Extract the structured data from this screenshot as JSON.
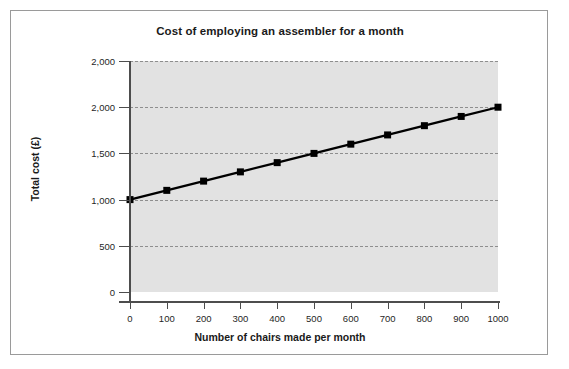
{
  "figure": {
    "border_color": "#9a9a9a",
    "background": "#ffffff"
  },
  "chart_data": {
    "type": "line",
    "title": "Cost of employing an assembler for a month",
    "xlabel": "Number of chairs made per month",
    "ylabel": "Total cost (£)",
    "x": [
      0,
      100,
      200,
      300,
      400,
      500,
      600,
      700,
      800,
      900,
      1000
    ],
    "values": [
      1000,
      1100,
      1200,
      1300,
      1400,
      1500,
      1600,
      1700,
      1800,
      1900,
      2000
    ],
    "series": [
      {
        "name": "Total cost",
        "values": [
          1000,
          1100,
          1200,
          1300,
          1400,
          1500,
          1600,
          1700,
          1800,
          1900,
          2000
        ]
      }
    ],
    "xlim": [
      0,
      1000
    ],
    "ylim": [
      0,
      2500
    ],
    "xticks": [
      0,
      100,
      200,
      300,
      400,
      500,
      600,
      700,
      800,
      900,
      1000
    ],
    "xtick_labels": [
      "0",
      "100",
      "200",
      "300",
      "400",
      "500",
      "600",
      "700",
      "800",
      "900",
      "1000"
    ],
    "yticks": [
      0,
      500,
      1000,
      1500,
      2000,
      2500
    ],
    "ytick_labels": [
      "0",
      "500",
      "1,000",
      "1,500",
      "2,000",
      "2,000"
    ],
    "grid": true,
    "grid_axis": "y",
    "grid_style": "dashed",
    "legend": false,
    "line_color": "#000000",
    "marker": "square",
    "marker_color": "#000000",
    "plot_background": "#e2e2e2"
  }
}
